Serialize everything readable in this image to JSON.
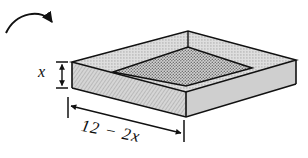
{
  "figure": {
    "labels": {
      "height_label": "x",
      "base_label": "12 − 2x"
    },
    "icons": {
      "fold_arrow": "curved-arrow-icon",
      "height_dimension": "vertical-dimension-arrow-icon",
      "base_dimension": "horizontal-dimension-arrow-icon"
    },
    "colors": {
      "outline": "#111111",
      "wall_fill": "#c9c9c9",
      "rim_fill": "#bdbdbd",
      "floor_fill": "#a9a9a9",
      "background": "#ffffff"
    },
    "geometry": {
      "top_back_vertex": "188,31",
      "left_vertex": "72,62",
      "right_vertex": "296,60",
      "front_vertex": "186,92",
      "front_bottom_vertex": "186,117",
      "left_bottom_vertex": "72,88",
      "right_bottom_vertex": "296,84",
      "inner_left": "113,72",
      "inner_right": "252,68",
      "inner_front": "186,92",
      "inner_back": "188,47"
    }
  }
}
